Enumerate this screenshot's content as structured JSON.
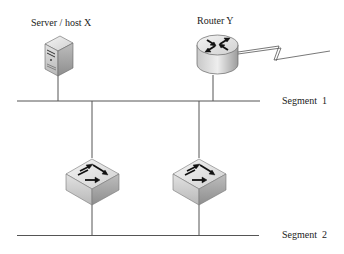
{
  "diagram": {
    "type": "network-topology",
    "nodes": [
      {
        "id": "server",
        "label": "Server / host X",
        "kind": "server"
      },
      {
        "id": "router",
        "label": "Router Y",
        "kind": "router"
      },
      {
        "id": "switch1",
        "label": "",
        "kind": "switch"
      },
      {
        "id": "switch2",
        "label": "",
        "kind": "switch"
      }
    ],
    "segments": [
      {
        "id": "seg1",
        "label": "Segment  1"
      },
      {
        "id": "seg2",
        "label": "Segment  2"
      }
    ],
    "edges": [
      {
        "from": "server",
        "to": "seg1"
      },
      {
        "from": "router",
        "to": "seg1"
      },
      {
        "from": "router",
        "to": "wan",
        "style": "lightning"
      },
      {
        "from": "seg1",
        "to": "switch1"
      },
      {
        "from": "seg1",
        "to": "switch2"
      },
      {
        "from": "switch1",
        "to": "seg2"
      },
      {
        "from": "switch2",
        "to": "seg2"
      }
    ],
    "colors": {
      "line": "#555555",
      "device_light": "#e6e6e6",
      "device_dark": "#9a9a9a",
      "arrow": "#111111"
    }
  }
}
